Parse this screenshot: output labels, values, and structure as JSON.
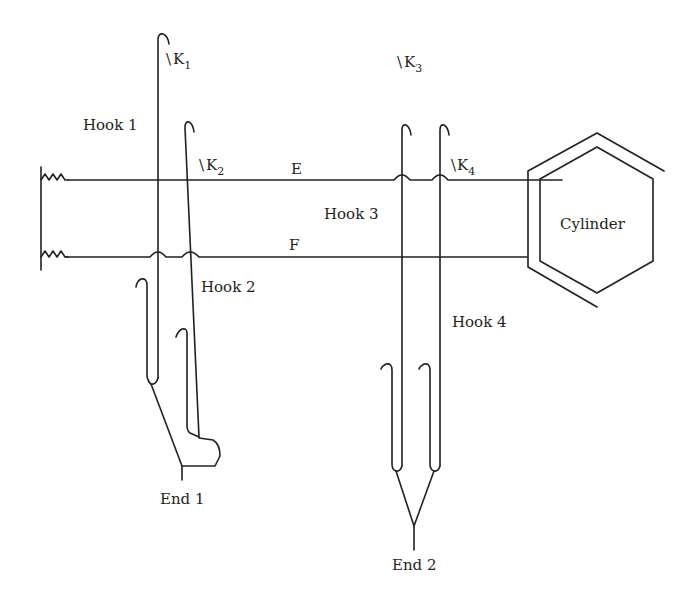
{
  "diagram": {
    "type": "jacquard-hook-mechanism",
    "stroke_color": "#231f20",
    "background": "#ffffff",
    "labels": {
      "hook1": "Hook 1",
      "hook2": "Hook 2",
      "hook3": "Hook 3",
      "hook4": "Hook 4",
      "end1": "End 1",
      "end2": "End 2",
      "cylinder": "Cylinder",
      "needle_e": "E",
      "needle_f": "F",
      "knife1": {
        "slash": "\\",
        "letter": "K",
        "sub": "1"
      },
      "knife2": {
        "slash": "\\",
        "letter": "K",
        "sub": "2"
      },
      "knife3": {
        "slash": "\\",
        "letter": "K",
        "sub": "3"
      },
      "knife4": {
        "slash": "\\",
        "letter": "K",
        "sub": "4"
      }
    },
    "components": [
      {
        "id": "needle-e",
        "label": "E",
        "kind": "horizontal needle (upper)"
      },
      {
        "id": "needle-f",
        "label": "F",
        "kind": "horizontal needle (lower)"
      },
      {
        "id": "hook-1",
        "label": "Hook 1",
        "connected_to": "End 1"
      },
      {
        "id": "hook-2",
        "label": "Hook 2",
        "connected_to": "End 1"
      },
      {
        "id": "hook-3",
        "label": "Hook 3",
        "connected_to": "End 2"
      },
      {
        "id": "hook-4",
        "label": "Hook 4",
        "connected_to": "End 2"
      },
      {
        "id": "cylinder",
        "label": "Cylinder",
        "shape": "hexagon"
      },
      {
        "id": "springs",
        "count": 2,
        "side": "left"
      }
    ]
  }
}
